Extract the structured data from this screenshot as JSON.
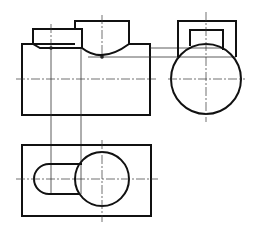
{
  "drawing": {
    "type": "orthographic-projection",
    "views": [
      "front-view",
      "side-view",
      "top-view"
    ],
    "colors": {
      "line": "#111111",
      "background": "#ffffff"
    },
    "front_view": {
      "body": {
        "x": 22,
        "y": 44,
        "w": 128,
        "h": 71
      },
      "left_block": {
        "x1": 33,
        "x2": 82,
        "top": 29
      },
      "cylinder_boss": {
        "x1": 75,
        "x2": 129,
        "top": 21,
        "arc_bottom": 57,
        "cx": 102
      },
      "centerline_y": 79
    },
    "side_view": {
      "outer_box": {
        "x1": 178,
        "x2": 236,
        "top": 21
      },
      "inner_box": {
        "x1": 190,
        "x2": 223,
        "top": 30
      },
      "circle": {
        "cx": 206,
        "cy": 79,
        "r": 35
      }
    },
    "top_view": {
      "body": {
        "x": 22,
        "y": 145,
        "w": 129,
        "h": 71
      },
      "circle": {
        "cx": 102,
        "cy": 179,
        "r": 27
      },
      "slot": {
        "x_left": 34,
        "x_right": 82,
        "y_top": 164,
        "y_bottom": 194
      },
      "centerline_y": 179
    }
  }
}
